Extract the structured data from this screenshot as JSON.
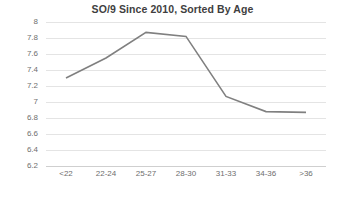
{
  "chart_data": {
    "type": "line",
    "title": "SO/9 Since 2010, Sorted By Age",
    "xlabel": "",
    "ylabel": "",
    "categories": [
      "<22",
      "22-24",
      "25-27",
      "28-30",
      "31-33",
      "34-36",
      ">36"
    ],
    "series": [
      {
        "name": "SO/9",
        "values": [
          7.3,
          7.55,
          7.87,
          7.82,
          7.07,
          6.88,
          6.87
        ],
        "color": "#808080"
      }
    ],
    "ylim": [
      6.2,
      8.0
    ],
    "yticks": [
      8,
      7.8,
      7.6,
      7.4,
      7.2,
      7,
      6.8,
      6.6,
      6.4,
      6.2
    ],
    "ytick_labels": [
      "8",
      "7.8",
      "7.6",
      "7.4",
      "7.2",
      "7",
      "6.8",
      "6.6",
      "6.4",
      "6.2"
    ],
    "grid": true,
    "gridline_color": "#e4e4e4",
    "axis_color": "#cfcfcf",
    "legend": false,
    "legend_position": "none",
    "markers": false,
    "title_color": "#3f3f3f",
    "tick_label_color": "#6e6e6e",
    "background_color": "#ffffff"
  }
}
